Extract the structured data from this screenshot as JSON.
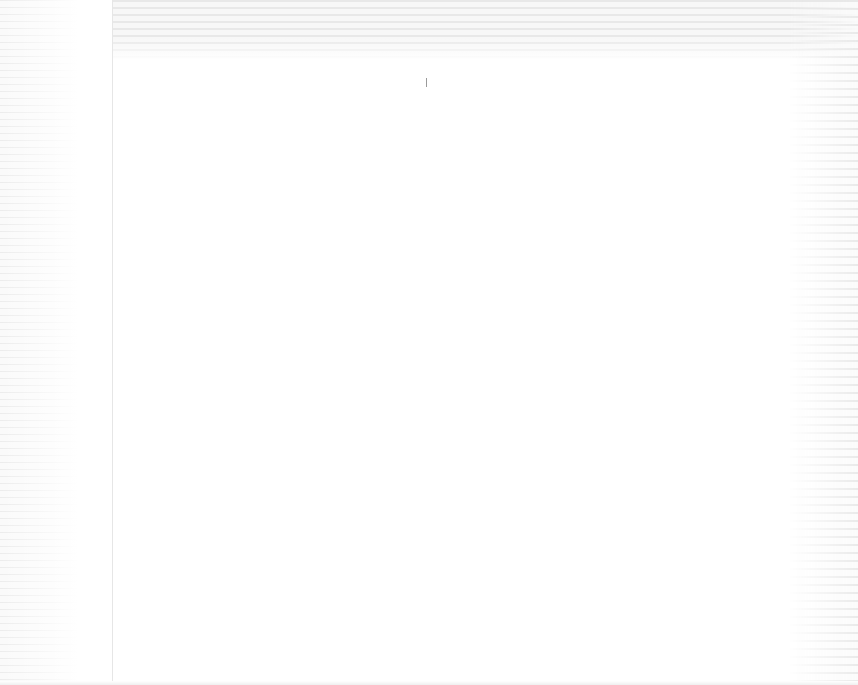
{
  "window": {
    "title": "",
    "state": "washed-out / faded screenshot — no legible text"
  },
  "toolbar": {
    "label": ""
  },
  "sidebar": {
    "items": []
  },
  "main": {
    "content": ""
  },
  "colors": {
    "background": "#ffffff",
    "stripe": "#e4e4e4",
    "divider": "#e6e6e6",
    "cursor": "#9a9a9a"
  }
}
